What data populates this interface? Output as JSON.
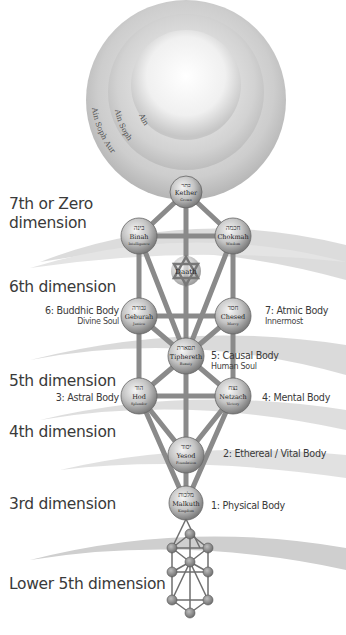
{
  "veils": [
    {
      "label": "Ain",
      "radius": 55
    },
    {
      "label": "Ain Soph",
      "radius": 78
    },
    {
      "label": "Ain Soph Aur",
      "radius": 100
    }
  ],
  "dimensions": [
    {
      "id": "7th",
      "label_line1": "7th or Zero",
      "label_line2": "dimension"
    },
    {
      "id": "6th",
      "label": "6th dimension"
    },
    {
      "id": "5th",
      "label": "5th dimension"
    },
    {
      "id": "4th",
      "label": "4th dimension"
    },
    {
      "id": "3rd",
      "label": "3rd dimension"
    },
    {
      "id": "lower5th",
      "label": "Lower 5th dimension"
    }
  ],
  "sephiroth": [
    {
      "name": "Kether",
      "hebrew": "כתר",
      "meaning": "Crown",
      "x": 186,
      "y": 192
    },
    {
      "name": "Binah",
      "hebrew": "בינה",
      "meaning": "Intelligence",
      "x": 139,
      "y": 236
    },
    {
      "name": "Chokmah",
      "hebrew": "חכמה",
      "meaning": "Wisdom",
      "x": 233,
      "y": 236
    },
    {
      "name": "Daath",
      "hebrew": "",
      "meaning": "",
      "x": 186,
      "y": 271
    },
    {
      "name": "Geburah",
      "hebrew": "גבורה",
      "meaning": "Justice",
      "x": 139,
      "y": 316
    },
    {
      "name": "Chesed",
      "hebrew": "חסד",
      "meaning": "Mercy",
      "x": 233,
      "y": 316
    },
    {
      "name": "Tiphereth",
      "hebrew": "תפארת",
      "meaning": "Beauty",
      "x": 186,
      "y": 356
    },
    {
      "name": "Hod",
      "hebrew": "הוד",
      "meaning": "Splendor",
      "x": 139,
      "y": 396
    },
    {
      "name": "Netzach",
      "hebrew": "נצח",
      "meaning": "Victory",
      "x": 233,
      "y": 396
    },
    {
      "name": "Yesod",
      "hebrew": "יסוד",
      "meaning": "Foundation",
      "x": 186,
      "y": 455
    },
    {
      "name": "Malkuth",
      "hebrew": "מלכות",
      "meaning": "Kingdom",
      "x": 186,
      "y": 503
    }
  ],
  "bodies": [
    {
      "id": "b6",
      "title": "6: Buddhic Body",
      "subtitle": "Divine Soul"
    },
    {
      "id": "b7",
      "title": "7: Atmic Body",
      "subtitle": "Innermost"
    },
    {
      "id": "b5",
      "title": "5: Causal Body",
      "subtitle": "Human Soul"
    },
    {
      "id": "b3",
      "title": "3: Astral Body"
    },
    {
      "id": "b4",
      "title": "4: Mental Body"
    },
    {
      "id": "b2",
      "title": "2: Ethereal / Vital Body"
    },
    {
      "id": "b1",
      "title": "1: Physical Body"
    }
  ],
  "colors": {
    "node_fill": "#b9b9b9",
    "path_color": "#8a8a8a",
    "text": "#3a3a3a",
    "band": "#cfcfcf"
  }
}
